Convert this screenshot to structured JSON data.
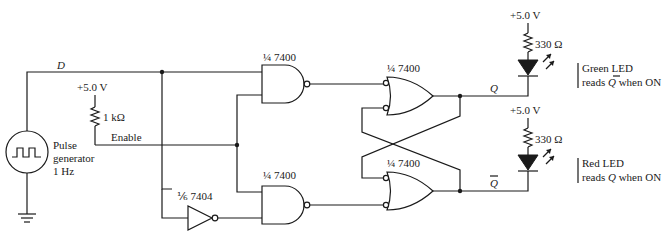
{
  "signals": {
    "d": "D",
    "enable": "Enable",
    "q": "Q",
    "qbar": "Q"
  },
  "supplies": {
    "pullup": "+5.0 V",
    "led_top": "+5.0 V",
    "led_bottom": "+5.0 V"
  },
  "resistors": {
    "pullup": "1 kΩ",
    "led_top": "330 Ω",
    "led_bottom": "330 Ω"
  },
  "source": {
    "line1": "Pulse",
    "line2": "generator",
    "line3": "1 Hz"
  },
  "chips": {
    "nand_top": "¼ 7400",
    "nand_bottom": "¼ 7400",
    "nor_top": "¼ 7400",
    "nor_bottom": "¼ 7400",
    "inverter": "⅙ 7404"
  },
  "leds": {
    "green_line1": "Green LED",
    "green_line2_pre": "reads ",
    "green_line2_sym": "Q",
    "green_line2_post": " when ON",
    "red_line1": "Red LED",
    "red_line2_pre": "reads ",
    "red_line2_sym": "Q",
    "red_line2_post": " when ON"
  }
}
